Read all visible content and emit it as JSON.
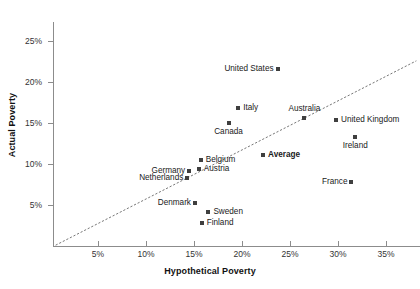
{
  "chart_data": {
    "type": "scatter",
    "title": "",
    "xlabel": "Hypothetical Poverty",
    "ylabel": "Actual Poverty",
    "xlim": [
      0,
      38
    ],
    "ylim": [
      0,
      26
    ],
    "xticks": [
      "5%",
      "10%",
      "15%",
      "20%",
      "25%",
      "30%",
      "35%"
    ],
    "xtick_values": [
      5,
      10,
      15,
      20,
      25,
      30,
      35
    ],
    "yticks": [
      "5%",
      "10%",
      "15%",
      "20%",
      "25%"
    ],
    "ytick_values": [
      5,
      10,
      15,
      20,
      25
    ],
    "grid": false,
    "legend": "none",
    "annotations": [
      {
        "name": "reference-line",
        "kind": "diagonal-dotted-line",
        "description": "dotted 45-degree reference line where actual poverty equals hypothetical poverty"
      }
    ],
    "points": [
      {
        "label": "United States",
        "x": 23.7,
        "y": 21.6,
        "label_pos": "left",
        "bold": false
      },
      {
        "label": "Italy",
        "x": 19.6,
        "y": 16.8,
        "label_pos": "right",
        "bold": false
      },
      {
        "label": "Australia",
        "x": 26.5,
        "y": 15.6,
        "label_pos": "above",
        "bold": false
      },
      {
        "label": "United Kingdom",
        "x": 29.8,
        "y": 15.4,
        "label_pos": "right",
        "bold": false
      },
      {
        "label": "Canada",
        "x": 18.6,
        "y": 15.0,
        "label_pos": "below",
        "bold": false
      },
      {
        "label": "Ireland",
        "x": 31.8,
        "y": 13.3,
        "label_pos": "below",
        "bold": false
      },
      {
        "label": "Average",
        "x": 22.2,
        "y": 11.1,
        "label_pos": "right",
        "bold": true
      },
      {
        "label": "Belgium",
        "x": 15.7,
        "y": 10.5,
        "label_pos": "right",
        "bold": false
      },
      {
        "label": "Germany",
        "x": 14.5,
        "y": 9.2,
        "label_pos": "left",
        "bold": false
      },
      {
        "label": "Austria",
        "x": 15.5,
        "y": 9.4,
        "label_pos": "right",
        "bold": false
      },
      {
        "label": "Netherlands",
        "x": 14.3,
        "y": 8.3,
        "label_pos": "left",
        "bold": false
      },
      {
        "label": "France",
        "x": 31.4,
        "y": 7.8,
        "label_pos": "left",
        "bold": false
      },
      {
        "label": "Denmark",
        "x": 15.1,
        "y": 5.2,
        "label_pos": "left",
        "bold": false
      },
      {
        "label": "Sweden",
        "x": 16.5,
        "y": 4.2,
        "label_pos": "right",
        "bold": false
      },
      {
        "label": "Finland",
        "x": 15.8,
        "y": 2.8,
        "label_pos": "right",
        "bold": false
      }
    ]
  }
}
